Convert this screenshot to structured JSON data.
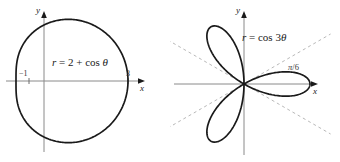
{
  "figure": {
    "background_color": "#ffffff",
    "curve_color": "#1a1a1a",
    "axis_color": "#8a8a8a",
    "dashed_color": "#b0b0b0",
    "width": 340,
    "height": 162
  },
  "panels": [
    {
      "id": "limacon",
      "equation_text": "r = 2 + cos θ",
      "equation_r": "r",
      "equation_body": " = 2 + cos ",
      "equation_theta": "θ",
      "x_axis_label": "x",
      "y_axis_label": "y",
      "tick_labels": [
        "−1",
        "3"
      ],
      "tick_left": "−1",
      "tick_right": "3"
    },
    {
      "id": "rose",
      "equation_text": "r = cos 3θ",
      "equation_r": "r",
      "equation_body": " = cos 3",
      "equation_theta": "θ",
      "x_axis_label": "x",
      "y_axis_label": "y",
      "angle_label_text": "π/6",
      "angle_label_pi": "π",
      "angle_label_denom": "/6"
    }
  ],
  "chart_data": [
    {
      "type": "line",
      "subtype": "polar",
      "title": "r = 2 + cos θ",
      "equation": "r = 2 + cos(theta)",
      "curve_name": "limaçon",
      "xlabel": "x",
      "ylabel": "y",
      "grid": false,
      "legend": "none",
      "xlim": [
        -1.6,
        3.4
      ],
      "ylim": [
        -2.3,
        2.3
      ],
      "tick_values": [
        -1,
        3
      ],
      "tick_labels": [
        "−1",
        "3"
      ],
      "theta_range_deg": [
        0,
        360
      ],
      "r_max": 3,
      "r_min": 1,
      "points_polar": [
        {
          "theta_deg": 0,
          "r": 3.0
        },
        {
          "theta_deg": 15,
          "r": 2.966
        },
        {
          "theta_deg": 30,
          "r": 2.866
        },
        {
          "theta_deg": 45,
          "r": 2.707
        },
        {
          "theta_deg": 60,
          "r": 2.5
        },
        {
          "theta_deg": 75,
          "r": 2.259
        },
        {
          "theta_deg": 90,
          "r": 2.0
        },
        {
          "theta_deg": 105,
          "r": 1.741
        },
        {
          "theta_deg": 120,
          "r": 1.5
        },
        {
          "theta_deg": 135,
          "r": 1.293
        },
        {
          "theta_deg": 150,
          "r": 1.134
        },
        {
          "theta_deg": 165,
          "r": 1.034
        },
        {
          "theta_deg": 180,
          "r": 1.0
        },
        {
          "theta_deg": 195,
          "r": 1.034
        },
        {
          "theta_deg": 210,
          "r": 1.134
        },
        {
          "theta_deg": 225,
          "r": 1.293
        },
        {
          "theta_deg": 240,
          "r": 1.5
        },
        {
          "theta_deg": 255,
          "r": 1.741
        },
        {
          "theta_deg": 270,
          "r": 2.0
        },
        {
          "theta_deg": 285,
          "r": 2.259
        },
        {
          "theta_deg": 300,
          "r": 2.5
        },
        {
          "theta_deg": 315,
          "r": 2.707
        },
        {
          "theta_deg": 330,
          "r": 2.866
        },
        {
          "theta_deg": 345,
          "r": 2.966
        },
        {
          "theta_deg": 360,
          "r": 3.0
        }
      ]
    },
    {
      "type": "line",
      "subtype": "polar",
      "title": "r = cos 3θ",
      "equation": "r = cos(3*theta)",
      "curve_name": "three-petal rose",
      "xlabel": "x",
      "ylabel": "y",
      "grid": false,
      "legend": "none",
      "xlim": [
        -1.2,
        1.2
      ],
      "ylim": [
        -1.2,
        1.2
      ],
      "petal_count": 3,
      "petal_axis_angles_deg": [
        0,
        120,
        240
      ],
      "r_max": 1,
      "annotations": [
        {
          "text": "π/6",
          "kind": "angle-of-tangent-line",
          "angle_deg": 30
        }
      ],
      "dashed_lines_deg": [
        30,
        150
      ],
      "theta_range_deg": [
        0,
        360
      ],
      "points_polar": [
        {
          "theta_deg": 0,
          "r": 1.0
        },
        {
          "theta_deg": 10,
          "r": 0.866
        },
        {
          "theta_deg": 20,
          "r": 0.5
        },
        {
          "theta_deg": 30,
          "r": 0.0
        },
        {
          "theta_deg": 40,
          "r": -0.5
        },
        {
          "theta_deg": 50,
          "r": -0.866
        },
        {
          "theta_deg": 60,
          "r": -1.0
        },
        {
          "theta_deg": 70,
          "r": -0.866
        },
        {
          "theta_deg": 80,
          "r": -0.5
        },
        {
          "theta_deg": 90,
          "r": 0.0
        },
        {
          "theta_deg": 100,
          "r": 0.5
        },
        {
          "theta_deg": 110,
          "r": 0.866
        },
        {
          "theta_deg": 120,
          "r": 1.0
        },
        {
          "theta_deg": 130,
          "r": 0.866
        },
        {
          "theta_deg": 140,
          "r": 0.5
        },
        {
          "theta_deg": 150,
          "r": 0.0
        },
        {
          "theta_deg": 160,
          "r": -0.5
        },
        {
          "theta_deg": 170,
          "r": -0.866
        },
        {
          "theta_deg": 180,
          "r": -1.0
        }
      ]
    }
  ]
}
